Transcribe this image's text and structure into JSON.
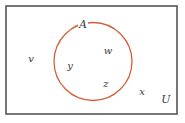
{
  "diagram": {
    "type": "venn",
    "universal_set": {
      "label": "U",
      "shape": "rectangle",
      "x": 6,
      "y": 6,
      "width": 171,
      "height": 108,
      "stroke_color": "#555555",
      "label_pos": {
        "x": 166,
        "y": 99
      }
    },
    "sets": [
      {
        "label": "A",
        "shape": "circle",
        "cx": 93,
        "cy": 61.5,
        "r": 39,
        "stroke_color": "#d2603a",
        "label_pos": {
          "x": 83,
          "y": 24
        },
        "elements": [
          {
            "label": "w",
            "x": 108,
            "y": 51
          },
          {
            "label": "y",
            "x": 70,
            "y": 66
          },
          {
            "label": "z",
            "x": 106,
            "y": 84
          }
        ]
      }
    ],
    "outside_elements": [
      {
        "label": "v",
        "x": 31,
        "y": 59
      },
      {
        "label": "x",
        "x": 142,
        "y": 92
      }
    ]
  }
}
